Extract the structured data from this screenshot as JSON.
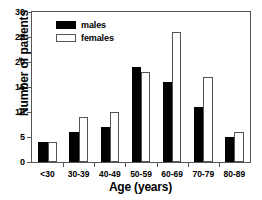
{
  "chart_data": {
    "type": "bar",
    "title": "",
    "xlabel": "Age (years)",
    "ylabel": "Number of patients",
    "categories": [
      "<30",
      "30-39",
      "40-49",
      "50-59",
      "60-69",
      "70-79",
      "80-89"
    ],
    "series": [
      {
        "name": "males",
        "values": [
          4,
          6,
          7,
          19,
          16,
          11,
          5
        ],
        "color": "#000000"
      },
      {
        "name": "females",
        "values": [
          4,
          9,
          10,
          18,
          26,
          17,
          6
        ],
        "color": "#ffffff"
      }
    ],
    "ylim": [
      0,
      30
    ],
    "yticks": [
      0,
      5,
      10,
      15,
      20,
      25,
      30
    ],
    "ytick_labels": [
      "0",
      "5",
      "10",
      "15",
      "20",
      "25",
      "30"
    ],
    "grid": false,
    "legend_position": "top-left",
    "legend": [
      "males",
      "females"
    ],
    "axis_color": "#555555"
  }
}
